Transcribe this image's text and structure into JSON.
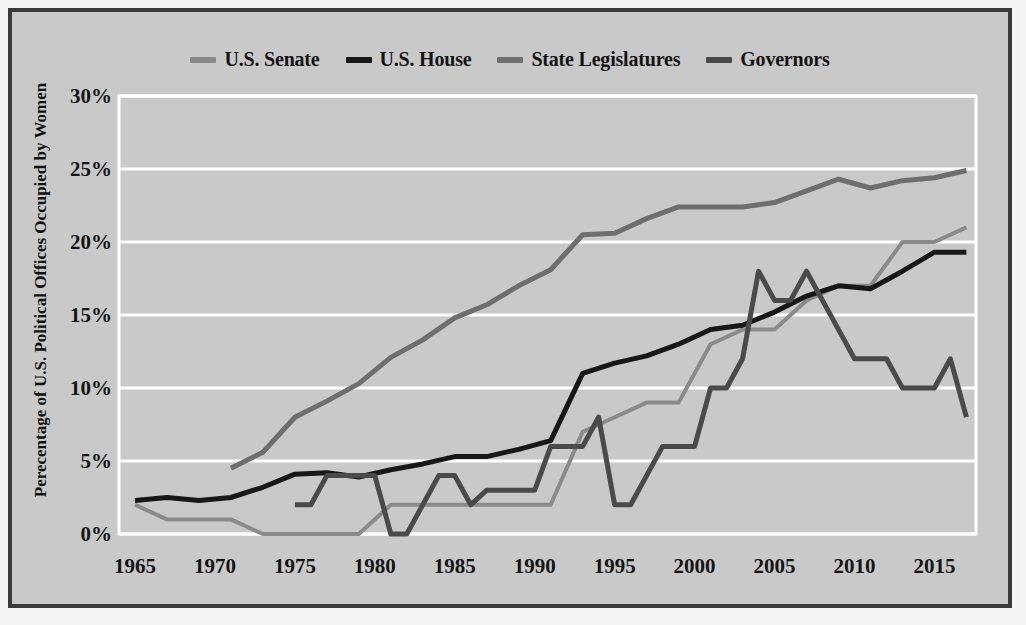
{
  "chart_data": {
    "type": "line",
    "title": "",
    "xlabel": "",
    "ylabel": "Perecentage of U.S. Political Offices Occupied by Women",
    "xlim": [
      1964,
      2017.6
    ],
    "ylim": [
      0,
      30
    ],
    "xticks": [
      1965,
      1970,
      1975,
      1980,
      1985,
      1990,
      1995,
      2000,
      2005,
      2010,
      2015
    ],
    "yticks": [
      0,
      5,
      10,
      15,
      20,
      25,
      30
    ],
    "ytick_labels": [
      "0%",
      "5%",
      "10%",
      "15%",
      "20%",
      "25%",
      "30%"
    ],
    "xtick_labels": [
      "1965",
      "1970",
      "1975",
      "1980",
      "1985",
      "1990",
      "1995",
      "2000",
      "2005",
      "2010",
      "2015"
    ],
    "grid": "horizontal",
    "grid_color": "#ffffff",
    "plot_background": "#c9c9c9",
    "legend_position": "top-center",
    "series": [
      {
        "name": "U.S. Senate",
        "color": "#8a8a8a",
        "linewidth": 4,
        "points": [
          [
            1965,
            2.0
          ],
          [
            1967,
            1.0
          ],
          [
            1969,
            1.0
          ],
          [
            1971,
            1.0
          ],
          [
            1973,
            0.0
          ],
          [
            1975,
            0.0
          ],
          [
            1977,
            0.0
          ],
          [
            1979,
            0.0
          ],
          [
            1981,
            2.0
          ],
          [
            1983,
            2.0
          ],
          [
            1985,
            2.0
          ],
          [
            1987,
            2.0
          ],
          [
            1989,
            2.0
          ],
          [
            1991,
            2.0
          ],
          [
            1993,
            7.0
          ],
          [
            1995,
            8.0
          ],
          [
            1997,
            9.0
          ],
          [
            1999,
            9.0
          ],
          [
            2001,
            13.0
          ],
          [
            2003,
            14.0
          ],
          [
            2005,
            14.0
          ],
          [
            2007,
            16.0
          ],
          [
            2009,
            17.0
          ],
          [
            2011,
            17.0
          ],
          [
            2013,
            20.0
          ],
          [
            2015,
            20.0
          ],
          [
            2017,
            21.0
          ]
        ]
      },
      {
        "name": "U.S. House",
        "color": "#171717",
        "linewidth": 5,
        "points": [
          [
            1965,
            2.3
          ],
          [
            1967,
            2.5
          ],
          [
            1969,
            2.3
          ],
          [
            1971,
            2.5
          ],
          [
            1973,
            3.2
          ],
          [
            1975,
            4.1
          ],
          [
            1977,
            4.2
          ],
          [
            1979,
            3.9
          ],
          [
            1981,
            4.4
          ],
          [
            1983,
            4.8
          ],
          [
            1985,
            5.3
          ],
          [
            1987,
            5.3
          ],
          [
            1989,
            5.8
          ],
          [
            1991,
            6.4
          ],
          [
            1993,
            11.0
          ],
          [
            1995,
            11.7
          ],
          [
            1997,
            12.2
          ],
          [
            1999,
            13.0
          ],
          [
            2001,
            14.0
          ],
          [
            2003,
            14.3
          ],
          [
            2005,
            15.2
          ],
          [
            2007,
            16.3
          ],
          [
            2009,
            17.0
          ],
          [
            2011,
            16.8
          ],
          [
            2013,
            18.0
          ],
          [
            2015,
            19.3
          ],
          [
            2017,
            19.3
          ]
        ]
      },
      {
        "name": "State Legislatures",
        "color": "#6e6e6e",
        "linewidth": 5,
        "points": [
          [
            1971,
            4.5
          ],
          [
            1973,
            5.6
          ],
          [
            1975,
            8.0
          ],
          [
            1977,
            9.1
          ],
          [
            1979,
            10.3
          ],
          [
            1981,
            12.1
          ],
          [
            1983,
            13.3
          ],
          [
            1985,
            14.8
          ],
          [
            1987,
            15.7
          ],
          [
            1989,
            17.0
          ],
          [
            1991,
            18.1
          ],
          [
            1993,
            20.5
          ],
          [
            1995,
            20.6
          ],
          [
            1997,
            21.6
          ],
          [
            1999,
            22.4
          ],
          [
            2001,
            22.4
          ],
          [
            2003,
            22.4
          ],
          [
            2005,
            22.7
          ],
          [
            2007,
            23.5
          ],
          [
            2009,
            24.3
          ],
          [
            2011,
            23.7
          ],
          [
            2013,
            24.2
          ],
          [
            2015,
            24.4
          ],
          [
            2017,
            24.9
          ]
        ]
      },
      {
        "name": "Governors",
        "color": "#4a4a4a",
        "linewidth": 5,
        "points": [
          [
            1975,
            2.0
          ],
          [
            1976,
            2.0
          ],
          [
            1977,
            4.0
          ],
          [
            1978,
            4.0
          ],
          [
            1979,
            4.0
          ],
          [
            1980,
            4.0
          ],
          [
            1981,
            0.0
          ],
          [
            1982,
            0.0
          ],
          [
            1983,
            2.0
          ],
          [
            1984,
            4.0
          ],
          [
            1985,
            4.0
          ],
          [
            1986,
            2.0
          ],
          [
            1987,
            3.0
          ],
          [
            1988,
            3.0
          ],
          [
            1989,
            3.0
          ],
          [
            1990,
            3.0
          ],
          [
            1991,
            6.0
          ],
          [
            1992,
            6.0
          ],
          [
            1993,
            6.0
          ],
          [
            1994,
            8.0
          ],
          [
            1995,
            2.0
          ],
          [
            1996,
            2.0
          ],
          [
            1997,
            4.0
          ],
          [
            1998,
            6.0
          ],
          [
            1999,
            6.0
          ],
          [
            2000,
            6.0
          ],
          [
            2001,
            10.0
          ],
          [
            2002,
            10.0
          ],
          [
            2003,
            12.0
          ],
          [
            2004,
            18.0
          ],
          [
            2005,
            16.0
          ],
          [
            2006,
            16.0
          ],
          [
            2007,
            18.0
          ],
          [
            2008,
            16.0
          ],
          [
            2009,
            14.0
          ],
          [
            2010,
            12.0
          ],
          [
            2011,
            12.0
          ],
          [
            2012,
            12.0
          ],
          [
            2013,
            10.0
          ],
          [
            2014,
            10.0
          ],
          [
            2015,
            10.0
          ],
          [
            2016,
            12.0
          ],
          [
            2017,
            8.0
          ]
        ]
      }
    ]
  },
  "legend": {
    "items": [
      {
        "label": "U.S. Senate",
        "color": "#8a8a8a"
      },
      {
        "label": "U.S. House",
        "color": "#171717"
      },
      {
        "label": "State Legislatures",
        "color": "#6e6e6e"
      },
      {
        "label": "Governors",
        "color": "#4a4a4a"
      }
    ]
  },
  "axes": {
    "y_title": "Perecentage of U.S. Political Offices Occupied by Women"
  }
}
